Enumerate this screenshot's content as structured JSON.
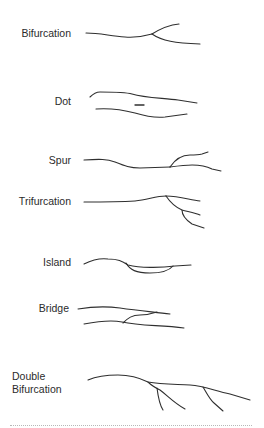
{
  "diagram": {
    "type": "minutiae-illustration",
    "items": [
      {
        "label": "Bifurcation"
      },
      {
        "label": "Dot"
      },
      {
        "label": "Spur"
      },
      {
        "label": "Trifurcation"
      },
      {
        "label": "Island"
      },
      {
        "label": "Bridge"
      },
      {
        "label_line1": "Double",
        "label_line2": "Bifurcation"
      }
    ],
    "colors": {
      "stroke": "#2f2f2f",
      "text": "#2b2b2b",
      "background": "#ffffff",
      "divider": "#b8b8b8"
    }
  }
}
